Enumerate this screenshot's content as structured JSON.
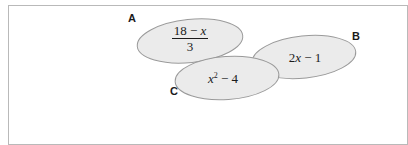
{
  "figure": {
    "name": "three-overlapping-ellipses-algebra-figure",
    "background_color": "#ffffff",
    "frame": {
      "border_color": "#b9b9b9",
      "fill_color": "#ffffff"
    },
    "ellipse_style": {
      "fill_color": "#ebebeb",
      "stroke_color": "#9a9a9a"
    },
    "text_color": "#1b1b1b",
    "ellipses": [
      {
        "label": "A",
        "expression_numerator": "18 − ",
        "expression_numerator_var": "x",
        "expression_denominator": "3",
        "expression_plain": "(18 − x) / 3",
        "cx": 190,
        "cy": 41,
        "rx": 53,
        "ry": 21.5,
        "rotation": -6
      },
      {
        "label": "B",
        "expression_coefficient": "2",
        "expression_var": "x",
        "expression_tail": " − 1",
        "expression_plain": "2x − 1",
        "cx": 304,
        "cy": 57,
        "rx": 52,
        "ry": 21,
        "rotation": -6
      },
      {
        "label": "C",
        "expression_var": "x",
        "expression_exponent": "2",
        "expression_tail": " − 4",
        "expression_plain": "x² − 4",
        "cx": 227,
        "cy": 78,
        "rx": 52,
        "ry": 21.5,
        "rotation": -4
      }
    ]
  }
}
